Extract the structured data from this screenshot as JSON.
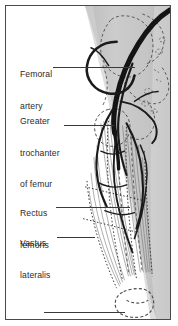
{
  "figure": {
    "kind": "anatomical-illustration",
    "region": "anterior thigh",
    "background_color": "#ffffff",
    "frame_color": "#4a4a4a",
    "limb_shading_color": "#c9c9c9",
    "vessel_color": "#1a1a1a",
    "bone_outline_color": "#555555",
    "muscle_striation_color": "#6e6e6e"
  },
  "labels": [
    {
      "id": "femoral-artery",
      "line1": "Femoral",
      "line2": "artery"
    },
    {
      "id": "greater-trochanter",
      "line1": "Greater",
      "line2": "trochanter",
      "line3": "of femur"
    },
    {
      "id": "rectus-femoris",
      "line1": "Rectus",
      "line2": "femoris"
    },
    {
      "id": "vastus-lateralis",
      "line1": "Vastus",
      "line2": "lateralis"
    },
    {
      "id": "knee",
      "line1": "Knee"
    }
  ]
}
